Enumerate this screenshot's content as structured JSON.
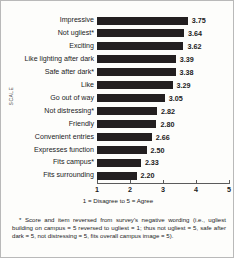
{
  "chart_data": {
    "type": "bar",
    "orientation": "horizontal",
    "title": "",
    "xlabel": "1 = Disagree to 5 = Agree",
    "ylabel": "SCALE",
    "xlim": [
      1,
      5
    ],
    "xticks": [
      "1",
      "2",
      "3",
      "4",
      "5"
    ],
    "grid": false,
    "legend": null,
    "bar_color": "#231f20",
    "categories": [
      "Impressive",
      "Not ugliest*",
      "Exciting",
      "Like lighting after dark",
      "Safe after dark*",
      "Like",
      "Go out of way",
      "Not distressing*",
      "Friendly",
      "Convenient entries",
      "Expresses function",
      "Fits campus*",
      "Fits surrounding"
    ],
    "values": [
      3.75,
      3.64,
      3.62,
      3.39,
      3.38,
      3.29,
      3.05,
      2.82,
      2.8,
      2.66,
      2.5,
      2.33,
      2.2
    ],
    "value_labels": [
      "3.75",
      "3.64",
      "3.62",
      "3.39",
      "3.38",
      "3.29",
      "3.05",
      "2.82",
      "2.80",
      "2.66",
      "2.50",
      "2.33",
      "2.20"
    ]
  },
  "footnote": "* Score and item reversed from survey's negative wording (i.e., ugliest building on campus = 5 reversed to ugliest = 1; thus not ugliest = 5, safe after dark = 5, not distressing = 5, fits overall campus image = 5)."
}
